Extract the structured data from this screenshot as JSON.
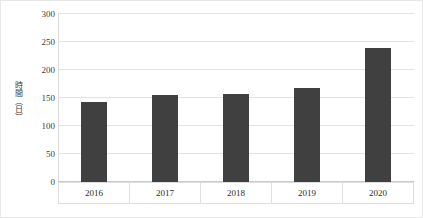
{
  "chart_data": {
    "type": "bar",
    "title": "",
    "subtitle": "",
    "xlabel": "",
    "ylabel": "時間（日）",
    "categories": [
      "2016",
      "2017",
      "2018",
      "2019",
      "2020"
    ],
    "values": [
      142,
      155,
      157,
      168,
      240
    ],
    "series": [
      {
        "name": "時間（日）",
        "values": [
          142,
          155,
          157,
          168,
          240
        ]
      }
    ],
    "ylim": [
      0,
      300
    ],
    "ytick_labels": [
      "0",
      "50",
      "100",
      "150",
      "200",
      "250",
      "300"
    ],
    "ytick_values": [
      0,
      50,
      100,
      150,
      200,
      250,
      300
    ],
    "grid": true,
    "grid_axis": "y",
    "legend": false,
    "legend_position": "none",
    "bar_color": "#404040",
    "gridline_color": "#e3e3e3",
    "axis_color": "#d9d9d9",
    "plot_background": "#ffffff",
    "annotations": []
  }
}
